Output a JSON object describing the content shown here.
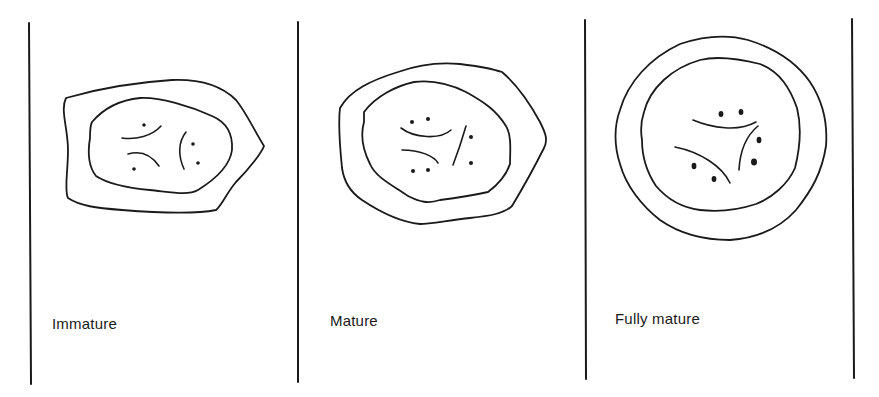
{
  "figure": {
    "type": "stage-diagram",
    "stroke_color": "#1a1a1a",
    "background": "#ffffff",
    "panels": [
      {
        "id": "immature",
        "label": "Immature",
        "dots": 5,
        "inner_strands": 3
      },
      {
        "id": "mature",
        "label": "Mature",
        "dots": 6,
        "inner_strands": 3
      },
      {
        "id": "fully-mature",
        "label": "Fully mature",
        "dots": 6,
        "inner_strands": 3
      }
    ]
  }
}
